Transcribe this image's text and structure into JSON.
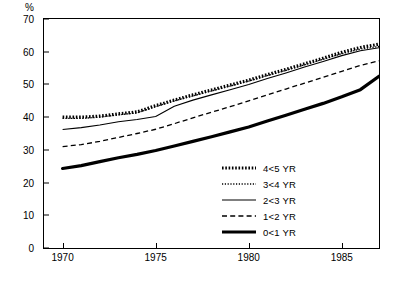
{
  "chart_data": {
    "type": "line",
    "title": "",
    "xlabel": "",
    "ylabel": "%",
    "xlim": [
      1969,
      1987
    ],
    "ylim": [
      0,
      70
    ],
    "xticks": [
      1970,
      1975,
      1980,
      1985
    ],
    "yticks": [
      0,
      10,
      20,
      30,
      40,
      50,
      60,
      70
    ],
    "grid": false,
    "legend_position": "inside-right",
    "x": [
      1970,
      1971,
      1972,
      1973,
      1974,
      1975,
      1976,
      1977,
      1978,
      1979,
      1980,
      1981,
      1982,
      1983,
      1984,
      1985,
      1986,
      1987
    ],
    "series": [
      {
        "name": "4<5 YR",
        "style": "thick-dotted",
        "color": "#000000",
        "values": [
          40.0,
          40.0,
          40.3,
          41.0,
          41.6,
          43.5,
          45.2,
          46.8,
          48.3,
          49.8,
          51.3,
          53.0,
          54.6,
          56.3,
          58.0,
          59.8,
          61.3,
          62.3
        ]
      },
      {
        "name": "3<4 YR",
        "style": "fine-dotted",
        "color": "#000000",
        "values": [
          39.6,
          39.6,
          40.0,
          40.7,
          41.3,
          43.2,
          45.0,
          46.5,
          48.0,
          49.5,
          51.0,
          52.7,
          54.3,
          56.0,
          57.7,
          59.4,
          60.8,
          61.6
        ]
      },
      {
        "name": "2<3 YR",
        "style": "thin-solid",
        "color": "#000000",
        "values": [
          36.2,
          36.8,
          37.6,
          38.6,
          39.3,
          40.2,
          43.3,
          45.2,
          46.8,
          48.4,
          50.0,
          51.8,
          53.5,
          55.3,
          57.0,
          58.8,
          60.3,
          61.2
        ]
      },
      {
        "name": "1<2 YR",
        "style": "dashed",
        "color": "#000000",
        "values": [
          31.0,
          31.6,
          32.6,
          33.8,
          35.0,
          36.3,
          38.0,
          39.8,
          41.5,
          43.2,
          45.0,
          46.8,
          48.6,
          50.4,
          52.2,
          54.0,
          55.8,
          57.2
        ]
      },
      {
        "name": "0<1 YR",
        "style": "thick-solid",
        "color": "#000000",
        "values": [
          24.3,
          25.2,
          26.4,
          27.6,
          28.6,
          29.8,
          31.2,
          32.6,
          34.0,
          35.5,
          37.0,
          38.8,
          40.6,
          42.4,
          44.2,
          46.2,
          48.4,
          52.5
        ]
      }
    ]
  },
  "axis": {
    "y_unit": "%",
    "y_ticks": [
      "0",
      "10",
      "20",
      "30",
      "40",
      "50",
      "60",
      "70"
    ],
    "x_ticks": [
      "1970",
      "1975",
      "1980",
      "1985"
    ]
  },
  "legend": {
    "items": [
      {
        "label": "4<5 YR"
      },
      {
        "label": "3<4 YR"
      },
      {
        "label": "2<3 YR"
      },
      {
        "label": "1<2 YR"
      },
      {
        "label": "0<1 YR"
      }
    ]
  }
}
